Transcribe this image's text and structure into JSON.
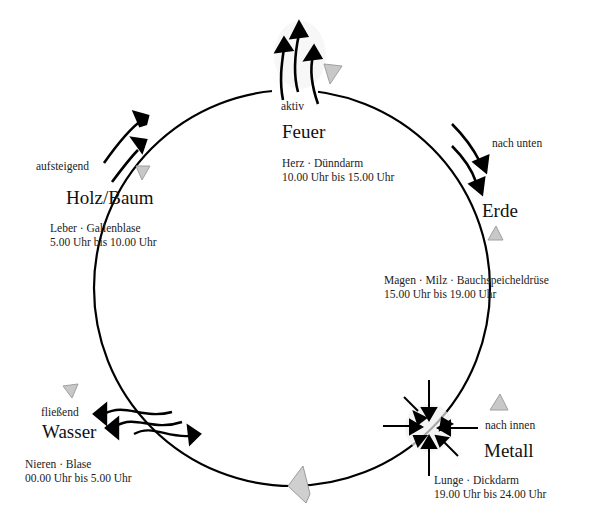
{
  "diagram": {
    "type": "five-elements-organ-clock",
    "circle": {
      "cx": 292,
      "cy": 288,
      "r": 198,
      "stroke": "#000000"
    },
    "elements": [
      {
        "key": "feuer",
        "name": "Feuer",
        "direction": "aktiv",
        "organs": "Herz · Dünndarm",
        "time": "10.00 Uhr bis 15.00 Uhr",
        "arrow_style": "three arrows pointing up"
      },
      {
        "key": "erde",
        "name": "Erde",
        "direction": "nach unten",
        "organs": "Magen · Milz · Bauchspeicheldrüse",
        "time": "15.00 Uhr bis 19.00 Uhr",
        "arrow_style": "two arrows pointing down"
      },
      {
        "key": "metall",
        "name": "Metall",
        "direction": "nach innen",
        "organs": "Lunge · Dickdarm",
        "time": "19.00 Uhr bis 24.00 Uhr",
        "arrow_style": "arrows converging inward"
      },
      {
        "key": "wasser",
        "name": "Wasser",
        "direction": "fließend",
        "organs": "Nieren · Blase",
        "time": "00.00 Uhr bis 5.00 Uhr",
        "arrow_style": "wavy arrows left and right"
      },
      {
        "key": "holz",
        "name": "Holz/Baum",
        "direction": "aufsteigend",
        "organs": "Leber · Gallenblase",
        "time": "5.00 Uhr bis 10.00 Uhr",
        "arrow_style": "two arrows rising diagonally"
      }
    ],
    "cycle_markers": {
      "icon": "triangle-icon",
      "color": "#b8b8b8",
      "count": 6
    }
  }
}
